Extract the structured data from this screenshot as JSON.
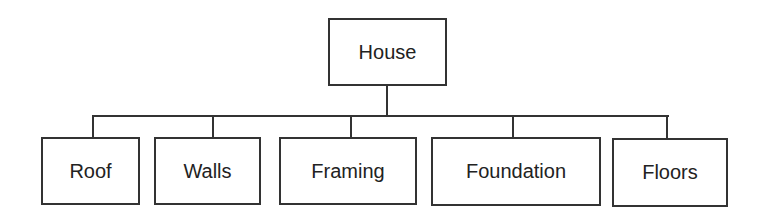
{
  "diagram": {
    "type": "hierarchy",
    "root": {
      "label": "House"
    },
    "children": [
      {
        "label": "Roof"
      },
      {
        "label": "Walls"
      },
      {
        "label": "Framing"
      },
      {
        "label": "Foundation"
      },
      {
        "label": "Floors"
      }
    ]
  },
  "colors": {
    "stroke": "#333333",
    "text": "#222222",
    "background": "#ffffff"
  }
}
